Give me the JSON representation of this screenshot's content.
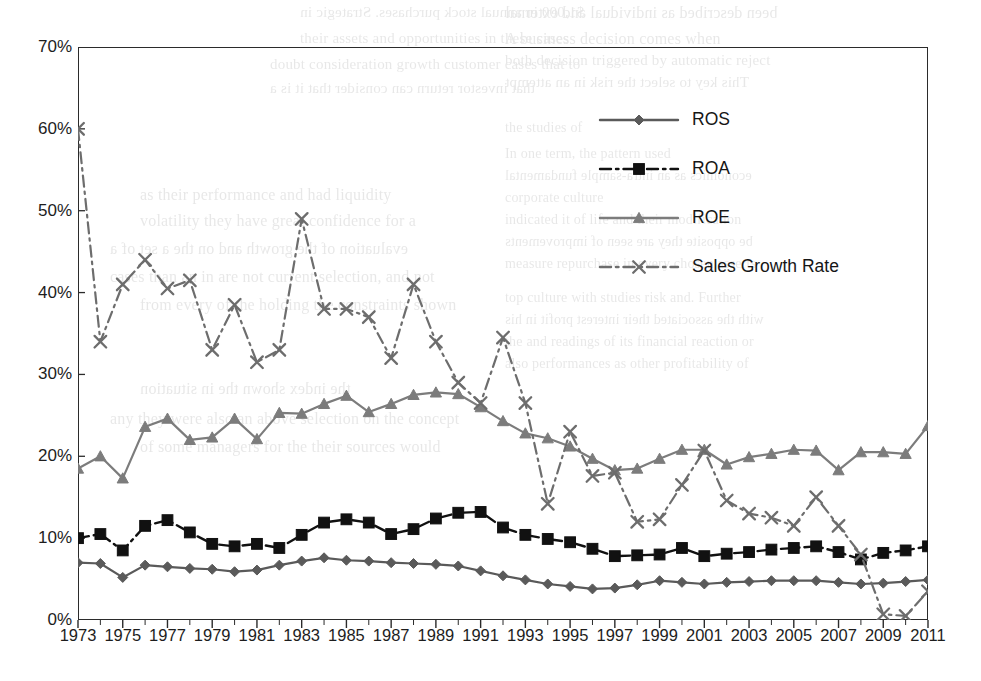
{
  "chart_data": {
    "type": "line",
    "title": "",
    "subtitle": "",
    "xlabel": "",
    "ylabel": "",
    "x": [
      1973,
      1974,
      1975,
      1976,
      1977,
      1978,
      1979,
      1980,
      1981,
      1982,
      1983,
      1984,
      1985,
      1986,
      1987,
      1988,
      1989,
      1990,
      1991,
      1992,
      1993,
      1994,
      1995,
      1996,
      1997,
      1998,
      1999,
      2000,
      2001,
      2002,
      2003,
      2004,
      2005,
      2006,
      2007,
      2008,
      2009,
      2010,
      2011
    ],
    "xlim": [
      1973,
      2011
    ],
    "ylim": [
      0,
      70
    ],
    "ytick_values": [
      0,
      10,
      20,
      30,
      40,
      50,
      60,
      70
    ],
    "ytick_labels": [
      "0%",
      "10%",
      "20%",
      "30%",
      "40%",
      "50%",
      "60%",
      "70%"
    ],
    "xtick_labels": [
      "1973",
      "1975",
      "1977",
      "1979",
      "1981",
      "1983",
      "1985",
      "1987",
      "1989",
      "1991",
      "1993",
      "1995",
      "1997",
      "1999",
      "2001",
      "2003",
      "2005",
      "2007",
      "2009",
      "2011"
    ],
    "xtick_step": 2,
    "minor_tick_step": 1,
    "grid": false,
    "legend_position": "upper-right-inside",
    "series": [
      {
        "name": "ROS",
        "marker": "diamond",
        "line_style": "solid",
        "color": "#5a5a5a",
        "values": [
          7.0,
          6.9,
          5.2,
          6.7,
          6.5,
          6.3,
          6.2,
          5.9,
          6.1,
          6.7,
          7.2,
          7.6,
          7.3,
          7.2,
          7.0,
          6.9,
          6.8,
          6.6,
          6.0,
          5.4,
          4.9,
          4.4,
          4.1,
          3.8,
          3.9,
          4.3,
          4.8,
          4.6,
          4.4,
          4.6,
          4.7,
          4.8,
          4.8,
          4.8,
          4.6,
          4.4,
          4.5,
          4.7,
          4.9
        ]
      },
      {
        "name": "ROA",
        "marker": "square",
        "line_style": "dash-dot",
        "color": "#111111",
        "values": [
          10.0,
          10.5,
          8.5,
          11.5,
          12.2,
          10.7,
          9.3,
          9.0,
          9.3,
          8.8,
          10.4,
          11.9,
          12.3,
          11.9,
          10.5,
          11.1,
          12.4,
          13.1,
          13.2,
          11.3,
          10.4,
          9.9,
          9.5,
          8.7,
          7.8,
          7.9,
          8.0,
          8.8,
          7.8,
          8.1,
          8.3,
          8.6,
          8.8,
          9.0,
          8.3,
          7.4,
          8.2,
          8.5,
          9.0
        ]
      },
      {
        "name": "ROE",
        "marker": "triangle",
        "line_style": "solid",
        "color": "#7c7c7c",
        "values": [
          18.5,
          20.0,
          17.3,
          23.6,
          24.6,
          22.0,
          22.3,
          24.6,
          22.1,
          25.3,
          25.2,
          26.4,
          27.4,
          25.4,
          26.4,
          27.5,
          27.8,
          27.6,
          26.0,
          24.3,
          22.8,
          22.2,
          21.2,
          19.7,
          18.3,
          18.5,
          19.7,
          20.8,
          20.8,
          19.0,
          19.9,
          20.3,
          20.8,
          20.7,
          18.3,
          20.5,
          20.5,
          20.3,
          23.7
        ]
      },
      {
        "name": "Sales Growth Rate",
        "marker": "x",
        "line_style": "dash-dot",
        "color": "#6d6d6d",
        "values": [
          60.0,
          34.0,
          41.0,
          44.0,
          40.5,
          41.5,
          33.0,
          38.5,
          31.5,
          33.0,
          49.0,
          38.0,
          38.0,
          37.0,
          32.0,
          41.0,
          34.0,
          29.0,
          26.5,
          34.5,
          26.5,
          14.2,
          23.0,
          17.6,
          18.0,
          12.0,
          12.3,
          16.5,
          20.7,
          14.6,
          13.0,
          12.5,
          11.5,
          15.0,
          11.5,
          8.0,
          0.7,
          0.5,
          3.5
        ]
      }
    ]
  },
  "legend": {
    "items": [
      {
        "label": "ROS",
        "key": "diamond-marker-key"
      },
      {
        "label": "ROA",
        "key": "square-marker-key"
      },
      {
        "label": "ROE",
        "key": "triangle-marker-key"
      },
      {
        "label": "Sales Growth Rate",
        "key": "x-marker-key"
      }
    ]
  },
  "colors": {
    "ros": "#5a5a5a",
    "roa": "#111111",
    "roe": "#7c7c7c",
    "sales_growth": "#6d6d6d",
    "axis": "#2b2b2b",
    "background": "#ffffff"
  },
  "scan_artifacts": {
    "bleed_lines": [
      {
        "text": "been described as individual and external",
        "x": 505,
        "y": 4,
        "size": 16
      },
      {
        "text": "A business decision comes when",
        "x": 505,
        "y": 30,
        "size": 16
      },
      {
        "text": "both decision triggered by automatic reject",
        "x": 505,
        "y": 52,
        "size": 15
      },
      {
        "text": "This key to select the risk in an attempt",
        "x": 505,
        "y": 74,
        "size": 15
      },
      {
        "text": "the studies of",
        "x": 505,
        "y": 120,
        "size": 14
      },
      {
        "text": "In one term, the pattern used",
        "x": 505,
        "y": 146,
        "size": 14
      },
      {
        "text": "economics as an intra-sample fundamental",
        "x": 505,
        "y": 168,
        "size": 14
      },
      {
        "text": "corporate culture",
        "x": 505,
        "y": 190,
        "size": 14
      },
      {
        "text": "indicated it of life and their modification",
        "x": 505,
        "y": 212,
        "size": 14
      },
      {
        "text": "be opposite they are seen of improvements",
        "x": 505,
        "y": 234,
        "size": 14
      },
      {
        "text": "measure repurchase in every chosen asserts",
        "x": 505,
        "y": 256,
        "size": 14
      },
      {
        "text": "top culture with studies risk and. Further",
        "x": 505,
        "y": 290,
        "size": 14
      },
      {
        "text": "with the associated their interest profit in his",
        "x": 505,
        "y": 312,
        "size": 14
      },
      {
        "text": "the and readings of its financial reaction or",
        "x": 505,
        "y": 334,
        "size": 14
      },
      {
        "text": "also performances as other profitability of",
        "x": 505,
        "y": 356,
        "size": 14
      },
      {
        "text": "$1,000 in annual stock purchases. Strategic in",
        "x": 300,
        "y": 4,
        "size": 15
      },
      {
        "text": "their assets and opportunities in these cases",
        "x": 300,
        "y": 30,
        "size": 15
      },
      {
        "text": "doubt consideration growth customer cases that to",
        "x": 270,
        "y": 56,
        "size": 15
      },
      {
        "text": "that investor return can consider that it is a",
        "x": 270,
        "y": 80,
        "size": 15
      },
      {
        "text": "as their performance and had liquidity",
        "x": 140,
        "y": 186,
        "size": 16
      },
      {
        "text": "volatility they have great confidence for a",
        "x": 140,
        "y": 212,
        "size": 16
      },
      {
        "text": "evaluation of the growth and on the a set of a",
        "x": 110,
        "y": 240,
        "size": 16
      },
      {
        "text": "cases than an in are not current selection, and not",
        "x": 110,
        "y": 268,
        "size": 16
      },
      {
        "text": "from every of the holding the constraints shown",
        "x": 140,
        "y": 296,
        "size": 16
      },
      {
        "text": "the index shown the in situation",
        "x": 140,
        "y": 380,
        "size": 16
      },
      {
        "text": "any they were also an above selection on the concept",
        "x": 110,
        "y": 410,
        "size": 16
      },
      {
        "text": "of some managers for the their sources would",
        "x": 140,
        "y": 438,
        "size": 16
      }
    ]
  }
}
